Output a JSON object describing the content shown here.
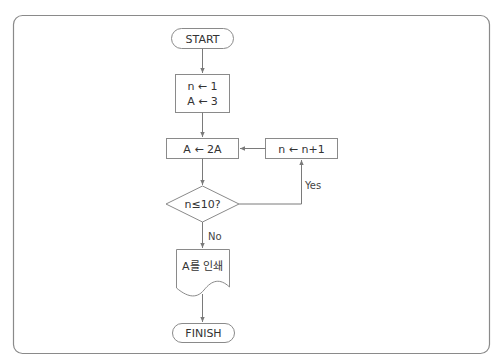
{
  "diagram": {
    "type": "flowchart",
    "colors": {
      "frame": "#8a8a8a",
      "line": "#7a7a7a",
      "text": "#333333",
      "background": "#ffffff"
    },
    "nodes": {
      "start": {
        "shape": "terminator",
        "label": "START"
      },
      "init": {
        "shape": "process",
        "lines": [
          "n ← 1",
          "A ← 3"
        ]
      },
      "double": {
        "shape": "process",
        "label": "A ← 2A"
      },
      "increment": {
        "shape": "process",
        "label": "n ← n+1"
      },
      "decision": {
        "shape": "decision",
        "label": "n≤10?"
      },
      "print": {
        "shape": "document",
        "label": "A를 인쇄"
      },
      "finish": {
        "shape": "terminator",
        "label": "FINISH"
      }
    },
    "edges": [
      {
        "from": "start",
        "to": "init",
        "label": ""
      },
      {
        "from": "init",
        "to": "double",
        "label": ""
      },
      {
        "from": "double",
        "to": "decision",
        "label": ""
      },
      {
        "from": "decision",
        "to": "increment",
        "label": "Yes"
      },
      {
        "from": "increment",
        "to": "double",
        "label": ""
      },
      {
        "from": "decision",
        "to": "print",
        "label": "No"
      },
      {
        "from": "print",
        "to": "finish",
        "label": ""
      }
    ],
    "edge_labels": {
      "yes": "Yes",
      "no": "No"
    }
  }
}
